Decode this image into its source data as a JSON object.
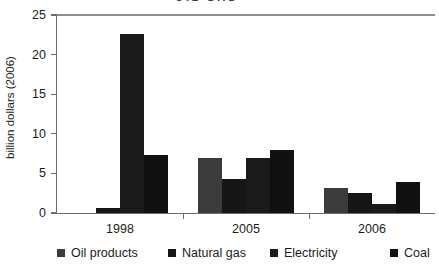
{
  "top_cropped_title": "OIL  GAS",
  "chart_data": {
    "type": "bar",
    "title": "",
    "xlabel": "",
    "ylabel": "billion dollars (2006)",
    "ylim": [
      0,
      25
    ],
    "yticks": [
      0,
      5,
      10,
      15,
      20,
      25
    ],
    "grid": false,
    "legend_position": "bottom",
    "categories": [
      "1998",
      "2005",
      "2006"
    ],
    "series": [
      {
        "name": "Oil products",
        "color": "#3b3b3b",
        "values": [
          0.0,
          7.0,
          3.2
        ]
      },
      {
        "name": "Natural gas",
        "color": "#161616",
        "values": [
          0.6,
          4.3,
          2.5
        ]
      },
      {
        "name": "Electricity",
        "color": "#1a1a1a",
        "values": [
          22.6,
          7.0,
          1.2
        ]
      },
      {
        "name": "Coal",
        "color": "#111111",
        "values": [
          7.3,
          8.0,
          3.9
        ]
      }
    ]
  },
  "legend": {
    "items": [
      {
        "label": "Oil products",
        "color": "#3b3b3b"
      },
      {
        "label": "Natural gas",
        "color": "#161616"
      },
      {
        "label": "Electricity",
        "color": "#1a1a1a"
      },
      {
        "label": "Coal",
        "color": "#111111"
      }
    ]
  }
}
